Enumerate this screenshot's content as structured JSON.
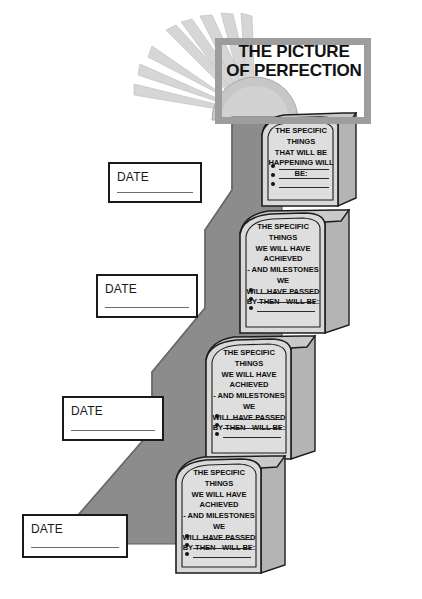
{
  "poster": {
    "title_lines": [
      "THE PICTURE",
      "OF PERFECTION"
    ],
    "background_color": "#ffffff",
    "ramp_color": "#8c8c8c",
    "ramp_shadow_color": "#737373",
    "block_face_color": "#d9d9d9",
    "block_side_color": "#b4b4b4",
    "frame_color": "#9d9d9d",
    "ink_color": "#111111",
    "sun_color": "#c9c9c9",
    "ray_color": "#d5d5d5"
  },
  "sun_icon": "sunburst-icon",
  "date_boxes": [
    {
      "label": "DATE",
      "value": ""
    },
    {
      "label": "DATE",
      "value": ""
    },
    {
      "label": "DATE",
      "value": ""
    },
    {
      "label": "DATE",
      "value": ""
    }
  ],
  "steps": [
    {
      "heading_lines": [
        "THE SPECIFIC THINGS",
        "THAT WILL BE",
        "HAPPENING WILL BE:"
      ],
      "bullets": [
        "",
        "",
        ""
      ]
    },
    {
      "heading_lines": [
        "THE SPECIFIC THINGS",
        "WE WILL HAVE ACHIEVED",
        "- AND MILESTONES WE",
        "WILL HAVE PASSED",
        "BY THEN - WILL BE:"
      ],
      "bullets": [
        "",
        "",
        ""
      ]
    },
    {
      "heading_lines": [
        "THE SPECIFIC THINGS",
        "WE WILL HAVE ACHIEVED",
        "- AND MILESTONES WE",
        "WILL HAVE PASSED",
        "BY THEN - WILL BE:"
      ],
      "bullets": [
        "",
        "",
        ""
      ]
    },
    {
      "heading_lines": [
        "THE SPECIFIC THINGS",
        "WE WILL HAVE ACHIEVED",
        "- AND MILESTONES WE",
        "WILL HAVE PASSED",
        "BY THEN - WILL BE:"
      ],
      "bullets": [
        "",
        "",
        ""
      ]
    }
  ]
}
